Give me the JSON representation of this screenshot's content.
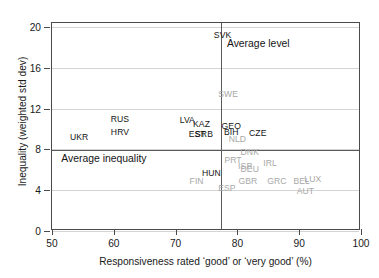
{
  "chart_data": {
    "type": "scatter",
    "title": "",
    "xlabel": "Responsiveness rated ‘good’ or ‘very good’ (%)",
    "ylabel": "Inequality (weighted std dev)",
    "xlim": [
      50,
      100
    ],
    "ylim": [
      0,
      20.4
    ],
    "xticks": [
      50,
      60,
      70,
      80,
      90,
      100
    ],
    "yticks": [
      0,
      4,
      8,
      12,
      16,
      20
    ],
    "grid": "horizontal",
    "legend": "none",
    "point_style": "text-labels-only",
    "reference_lines": [
      {
        "name": "average-inequality",
        "orient": "horizontal",
        "value": 7.9,
        "label": "Average inequality"
      },
      {
        "name": "average-level",
        "orient": "vertical",
        "value": 77.3,
        "label": "Average level"
      }
    ],
    "annotations": [
      {
        "name": "average-level-annotation",
        "text": "Average level",
        "x": 78.3,
        "y": 18.2
      },
      {
        "name": "average-inequality-annotation",
        "text": "Average inequality",
        "x": 51.5,
        "y": 7.0
      }
    ],
    "points": [
      {
        "label": "SVK",
        "x": 77.6,
        "y": 19.2,
        "shade": "dark"
      },
      {
        "label": "SWE",
        "x": 78.5,
        "y": 13.4,
        "shade": "light"
      },
      {
        "label": "RUS",
        "x": 61.0,
        "y": 11.0,
        "shade": "dark"
      },
      {
        "label": "LVA",
        "x": 71.9,
        "y": 10.9,
        "shade": "dark"
      },
      {
        "label": "KAZ",
        "x": 74.2,
        "y": 10.5,
        "shade": "dark"
      },
      {
        "label": "GEO",
        "x": 79.0,
        "y": 10.3,
        "shade": "dark"
      },
      {
        "label": "HRV",
        "x": 61.0,
        "y": 9.7,
        "shade": "dark"
      },
      {
        "label": "BIH",
        "x": 79.0,
        "y": 9.7,
        "shade": "dark"
      },
      {
        "label": "CZE",
        "x": 83.3,
        "y": 9.6,
        "shade": "dark"
      },
      {
        "label": "EST",
        "x": 73.5,
        "y": 9.5,
        "shade": "dark"
      },
      {
        "label": "SRB",
        "x": 74.6,
        "y": 9.5,
        "shade": "dark"
      },
      {
        "label": "NLD",
        "x": 80.0,
        "y": 9.0,
        "shade": "light"
      },
      {
        "label": "UKR",
        "x": 54.4,
        "y": 9.2,
        "shade": "dark"
      },
      {
        "label": "DNK",
        "x": 82.0,
        "y": 7.7,
        "shade": "light"
      },
      {
        "label": "PRT",
        "x": 79.3,
        "y": 7.0,
        "shade": "light"
      },
      {
        "label": "IRL",
        "x": 85.3,
        "y": 6.7,
        "shade": "light"
      },
      {
        "label": "ISR",
        "x": 81.3,
        "y": 6.4,
        "shade": "light"
      },
      {
        "label": "DEU",
        "x": 82.0,
        "y": 6.1,
        "shade": "light"
      },
      {
        "label": "HUN",
        "x": 75.8,
        "y": 5.7,
        "shade": "dark"
      },
      {
        "label": "FIN",
        "x": 73.4,
        "y": 4.9,
        "shade": "light"
      },
      {
        "label": "GBR",
        "x": 81.7,
        "y": 4.9,
        "shade": "light"
      },
      {
        "label": "GRC",
        "x": 86.4,
        "y": 4.9,
        "shade": "light"
      },
      {
        "label": "BEL",
        "x": 90.4,
        "y": 4.9,
        "shade": "light"
      },
      {
        "label": "LUX",
        "x": 92.2,
        "y": 5.1,
        "shade": "light"
      },
      {
        "label": "ESP",
        "x": 78.3,
        "y": 4.2,
        "shade": "light"
      },
      {
        "label": "AUT",
        "x": 91.0,
        "y": 3.9,
        "shade": "light"
      }
    ]
  }
}
